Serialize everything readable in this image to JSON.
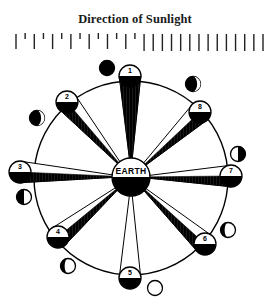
{
  "title": "Direction of Sunlight",
  "earth": {
    "label": "EARTH",
    "cx": 131,
    "cy": 177,
    "r": 19
  },
  "orbit": {
    "cx": 131,
    "cy": 178,
    "r": 97
  },
  "sunlight_ticks": {
    "count": 28,
    "x_start": 16,
    "x_end": 263,
    "y_top": 33,
    "long_length": 17,
    "short_length": 6
  },
  "moons": [
    {
      "id": 1,
      "label": "1",
      "cx": 130,
      "cy": 76,
      "phase_icon": "new-moon"
    },
    {
      "id": 2,
      "label": "2",
      "cx": 67,
      "cy": 102,
      "phase_icon": "waxing-crescent"
    },
    {
      "id": 3,
      "label": "3",
      "cx": 20,
      "cy": 172,
      "phase_icon": "first-quarter"
    },
    {
      "id": 4,
      "label": "4",
      "cx": 58,
      "cy": 237,
      "phase_icon": "waxing-gibbous"
    },
    {
      "id": 5,
      "label": "5",
      "cx": 130,
      "cy": 278,
      "phase_icon": "full-moon"
    },
    {
      "id": 6,
      "label": "6",
      "cx": 205,
      "cy": 244,
      "phase_icon": "waning-gibbous"
    },
    {
      "id": 7,
      "label": "7",
      "cx": 231,
      "cy": 176,
      "phase_icon": "last-quarter"
    },
    {
      "id": 8,
      "label": "8",
      "cx": 200,
      "cy": 112,
      "phase_icon": "waning-crescent"
    }
  ],
  "phase_views": [
    {
      "moon_id": 1,
      "cx": 107,
      "cy": 68,
      "phase": "new-moon"
    },
    {
      "moon_id": 2,
      "cx": 37,
      "cy": 118,
      "phase": "waxing-crescent"
    },
    {
      "moon_id": 3,
      "cx": 24,
      "cy": 197,
      "phase": "first-quarter"
    },
    {
      "moon_id": 4,
      "cx": 68,
      "cy": 266,
      "phase": "waxing-gibbous"
    },
    {
      "moon_id": 5,
      "cx": 155,
      "cy": 288,
      "phase": "full-moon"
    },
    {
      "moon_id": 6,
      "cx": 228,
      "cy": 230,
      "phase": "waning-gibbous"
    },
    {
      "moon_id": 7,
      "cx": 238,
      "cy": 154,
      "phase": "last-quarter"
    },
    {
      "moon_id": 8,
      "cx": 193,
      "cy": 84,
      "phase": "waning-crescent"
    }
  ],
  "moon_radius": 11,
  "phase_radius": 7.5
}
